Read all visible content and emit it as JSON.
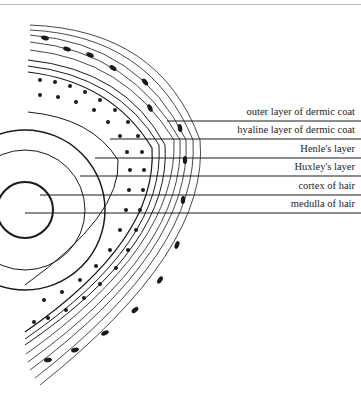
{
  "figure": {
    "labels": [
      {
        "text": "outer layer of dermic coat",
        "line_y": 121,
        "line_x_start": 167
      },
      {
        "text": "hyaline layer of dermic coat",
        "line_y": 139,
        "line_x_start": 110
      },
      {
        "text": "Henle's layer",
        "line_y": 158,
        "line_x_start": 95
      },
      {
        "text": "Huxley's layer",
        "line_y": 176,
        "line_x_start": 80
      },
      {
        "text": "cortex of hair",
        "line_y": 195,
        "line_x_start": 40
      },
      {
        "text": "medulla of hair",
        "line_y": 213,
        "line_x_start": 25
      }
    ]
  },
  "colors": {
    "ink": "#1a1a1a",
    "paper": "#ffffff"
  }
}
